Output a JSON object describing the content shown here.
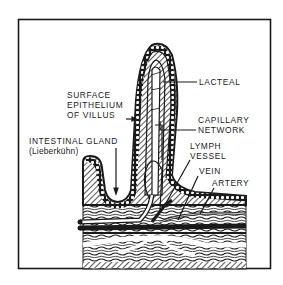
{
  "figure": {
    "colors": {
      "ink": "#1a1a1a",
      "paper": "#ffffff",
      "hatch": "#2a2a2a"
    }
  },
  "labels": {
    "lacteal": "LACTEAL",
    "surface_epithelium": {
      "line1": "SURFACE",
      "line2": "EPITHELIUM",
      "line3": "OF VILLUS"
    },
    "capillary_network": {
      "line1": "CAPILLARY",
      "line2": "NETWORK"
    },
    "intestinal_gland": {
      "line1": "INTESTINAL GLAND",
      "line2": "(Lieberkühn)"
    },
    "lymph_vessel": {
      "line1": "LYMPH",
      "line2": "VESSEL"
    },
    "vein": "VEIN",
    "artery": "ARTERY"
  }
}
